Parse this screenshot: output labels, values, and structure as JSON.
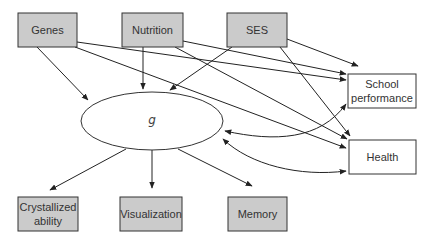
{
  "diagram": {
    "nodes": {
      "genes": {
        "label": "Genes",
        "style": "shaded"
      },
      "nutrition": {
        "label": "Nutrition",
        "style": "shaded"
      },
      "ses": {
        "label": "SES",
        "style": "shaded"
      },
      "school": {
        "label_lines": [
          "School",
          "performance"
        ],
        "style": "plain"
      },
      "health": {
        "label": "Health",
        "style": "plain"
      },
      "g": {
        "label": "g",
        "shape": "ellipse"
      },
      "crystallized": {
        "label_lines": [
          "Crystallized",
          "ability"
        ],
        "style": "shaded"
      },
      "visualization": {
        "label": "Visualization",
        "style": "shaded"
      },
      "memory": {
        "label": "Memory",
        "style": "shaded"
      }
    },
    "edges": [
      {
        "from": "genes",
        "to": "g",
        "type": "directed"
      },
      {
        "from": "genes",
        "to": "school",
        "type": "directed"
      },
      {
        "from": "genes",
        "to": "health",
        "type": "directed"
      },
      {
        "from": "nutrition",
        "to": "g",
        "type": "directed"
      },
      {
        "from": "nutrition",
        "to": "school",
        "type": "directed"
      },
      {
        "from": "nutrition",
        "to": "health",
        "type": "directed"
      },
      {
        "from": "ses",
        "to": "g",
        "type": "directed"
      },
      {
        "from": "ses",
        "to": "school",
        "type": "directed"
      },
      {
        "from": "ses",
        "to": "health",
        "type": "directed"
      },
      {
        "from": "g",
        "to": "school",
        "type": "bidirectional-curved"
      },
      {
        "from": "g",
        "to": "health",
        "type": "bidirectional-curved"
      },
      {
        "from": "g",
        "to": "crystallized",
        "type": "directed"
      },
      {
        "from": "g",
        "to": "visualization",
        "type": "directed"
      },
      {
        "from": "g",
        "to": "memory",
        "type": "directed"
      }
    ],
    "colors": {
      "shaded_fill": "#cbcbcb",
      "stroke": "#333333",
      "background": "#ffffff"
    }
  }
}
